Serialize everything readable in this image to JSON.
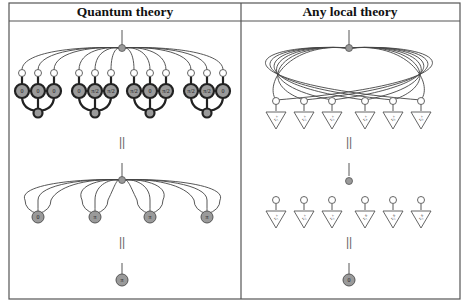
{
  "panels": {
    "left": {
      "title": "Quantum theory",
      "groups": [
        {
          "labels": [
            "0",
            "0",
            "0"
          ]
        },
        {
          "labels": [
            "0",
            "π/2",
            "π/2"
          ]
        },
        {
          "labels": [
            "π/2",
            "0",
            "π/2"
          ]
        },
        {
          "labels": [
            "π/2",
            "π/2",
            "0"
          ]
        }
      ],
      "equals_1": "||",
      "middle_labels": [
        "0",
        "π",
        "π",
        "π"
      ],
      "equals_2": "||",
      "result_label": "π"
    },
    "right": {
      "title": "Any local theory",
      "top_triangle_labels": [
        "r₁ᴬ",
        "r₂ᴬ",
        "r₃ᴬ",
        "r₄ᴬ",
        "r₅ᴬ",
        "r₆ᴬ"
      ],
      "equals_1": "||",
      "bottom_triangle_labels": [
        "r₁ᴬ",
        "r₂ᴬ",
        "r₃ᴬ",
        "r₁ᴮ",
        "r₂ᴮ",
        "r₃ᴮ"
      ],
      "equals_2": "||",
      "result_label": "0"
    }
  },
  "colors": {
    "node_fill": "#9a9a9a",
    "frame": "#555555"
  }
}
